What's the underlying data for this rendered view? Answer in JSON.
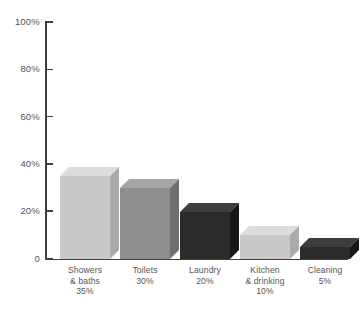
{
  "chart_data": {
    "type": "bar",
    "title": "",
    "subtitle": "",
    "xlabel": "",
    "ylabel": "",
    "categories": [
      "Showers\n& baths",
      "Toilets",
      "Laundry",
      "Kitchen\n& drinking",
      "Cleaning"
    ],
    "values": [
      35,
      30,
      20,
      10,
      5
    ],
    "value_labels": [
      "35%",
      "30%",
      "20%",
      "10%",
      "5%"
    ],
    "ylim": [
      0,
      100
    ],
    "yticks": [
      0,
      20,
      40,
      60,
      80,
      100
    ],
    "ytick_labels": [
      "0",
      "20%",
      "40%",
      "60%",
      "80%",
      "100%"
    ],
    "grid": false,
    "legend": "none",
    "style": "3d-isometric-bars",
    "series": [
      {
        "name": "Household water use",
        "values": [
          35,
          30,
          20,
          10,
          5
        ]
      }
    ],
    "bar_colors": [
      "#c9c9c9",
      "#8e8e8e",
      "#2b2b2b",
      "#c9c9c9",
      "#2b2b2b"
    ],
    "bar_top_colors": [
      "#dcdcdc",
      "#a6a6a6",
      "#3d3d3d",
      "#dcdcdc",
      "#3d3d3d"
    ],
    "bar_side_colors": [
      "#ababab",
      "#6f6f6f",
      "#171717",
      "#ababab",
      "#171717"
    ]
  },
  "axis": {
    "tick_color": "#3f3f3f",
    "label_color": "#555555"
  },
  "background": "#ffffff"
}
